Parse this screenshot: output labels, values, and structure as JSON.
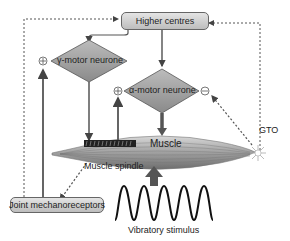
{
  "diagram": {
    "nodes": {
      "higher_centres": "Higher centres",
      "gamma_motor": "γ-motor neurone",
      "alpha_motor": "α-motor neurone",
      "muscle": "Muscle",
      "muscle_spindle": "Muscle spindle",
      "gto": "GTO",
      "joint_mechanoreceptors": "Joint mechanoreceptors",
      "vibratory_stimulus": "Vibratory stimulus"
    },
    "signs": {
      "gamma_input": "⊕",
      "alpha_input": "⊕",
      "alpha_inhibit": "⊖"
    },
    "colors": {
      "node_fill": "#9a9a9a",
      "line": "#555555",
      "background": "#ffffff"
    }
  }
}
